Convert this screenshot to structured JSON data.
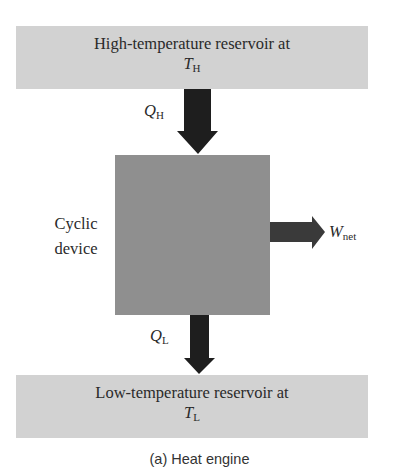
{
  "diagram": {
    "top_reservoir": {
      "line1": "High-temperature reservoir at",
      "symbol": "T",
      "subscript": "H"
    },
    "heat_in": {
      "symbol": "Q",
      "subscript": "H"
    },
    "device": {
      "line1": "Cyclic",
      "line2": "device"
    },
    "work_out": {
      "symbol": "W",
      "subscript": "net"
    },
    "heat_out": {
      "symbol": "Q",
      "subscript": "L"
    },
    "bottom_reservoir": {
      "line1": "Low-temperature reservoir at",
      "symbol": "T",
      "subscript": "L"
    },
    "caption": "(a) Heat engine",
    "colors": {
      "reservoir": "#d2d2d2",
      "device": "#8f8f8f",
      "arrow_vertical": "#1e1e1e",
      "arrow_work": "#3a3a3a"
    }
  }
}
